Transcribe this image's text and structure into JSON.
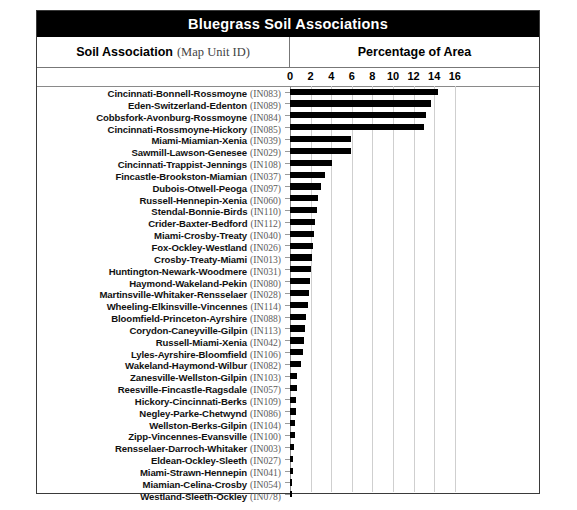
{
  "title": "Bluegrass Soil Associations",
  "header": {
    "left_bold": "Soil Association",
    "left_light": "(Map Unit ID)",
    "right": "Percentage of Area"
  },
  "chart_data": {
    "type": "bar",
    "orientation": "horizontal",
    "title": "Bluegrass Soil Associations",
    "xlabel": "Percentage of Area",
    "ylabel": "Soil Association (Map Unit ID)",
    "xlim": [
      0,
      16
    ],
    "xticks": [
      0,
      2,
      4,
      6,
      8,
      10,
      12,
      14,
      16
    ],
    "xtick_labels": [
      "0",
      "2",
      "4",
      "6",
      "8",
      "10",
      "12",
      "14",
      "16"
    ],
    "grid": true,
    "legend": false,
    "bar_color": "#000000",
    "categories": [
      "Cincinnati-Bonnell-Rossmoyne",
      "Eden-Switzerland-Edenton",
      "Cobbsfork-Avonburg-Rossmoyne",
      "Cincinnati-Rossmoyne-Hickory",
      "Miami-Miamian-Xenia",
      "Sawmill-Lawson-Genesee",
      "Cincinnati-Trappist-Jennings",
      "Fincastle-Brookston-Miamian",
      "Dubois-Otwell-Peoga",
      "Russell-Hennepin-Xenia",
      "Stendal-Bonnie-Birds",
      "Crider-Baxter-Bedford",
      "Miami-Crosby-Treaty",
      "Fox-Ockley-Westland",
      "Crosby-Treaty-Miami",
      "Huntington-Newark-Woodmere",
      "Haymond-Wakeland-Pekin",
      "Martinsville-Whitaker-Rensselaer",
      "Wheeling-Elkinsville-Vincennes",
      "Bloomfield-Princeton-Ayrshire",
      "Corydon-Caneyville-Gilpin",
      "Russell-Miami-Xenia",
      "Lyles-Ayrshire-Bloomfield",
      "Wakeland-Haymond-Wilbur",
      "Zanesville-Wellston-Gilpin",
      "Reesville-Fincastle-Ragsdale",
      "Hickory-Cincinnati-Berks",
      "Negley-Parke-Chetwynd",
      "Wellston-Berks-Gilpin",
      "Zipp-Vincennes-Evansville",
      "Rensselaer-Darroch-Whitaker",
      "Eldean-Ockley-Sleeth",
      "Miami-Strawn-Hennepin",
      "Miamian-Celina-Crosby",
      "Westland-Sleeth-Ockley"
    ],
    "map_unit_ids": [
      "(IN083)",
      "(IN089)",
      "(IN084)",
      "(IN085)",
      "(IN039)",
      "(IN029)",
      "(IN108)",
      "(IN037)",
      "(IN097)",
      "(IN060)",
      "(IN110)",
      "(IN112)",
      "(IN040)",
      "(IN026)",
      "(IN013)",
      "(IN031)",
      "(IN080)",
      "(IN028)",
      "(IN114)",
      "(IN088)",
      "(IN113)",
      "(IN042)",
      "(IN106)",
      "(IN082)",
      "(IN103)",
      "(IN057)",
      "(IN109)",
      "(IN086)",
      "(IN104)",
      "(IN100)",
      "(IN003)",
      "(IN027)",
      "(IN041)",
      "(IN054)",
      "(IN078)"
    ],
    "values": [
      14.4,
      13.7,
      13.2,
      13.0,
      5.9,
      5.9,
      4.1,
      3.4,
      3.0,
      2.7,
      2.6,
      2.4,
      2.3,
      2.2,
      2.1,
      2.0,
      1.9,
      1.8,
      1.7,
      1.6,
      1.5,
      1.4,
      1.3,
      1.1,
      0.7,
      0.65,
      0.6,
      0.55,
      0.5,
      0.45,
      0.4,
      0.3,
      0.25,
      0.2,
      0.15
    ],
    "value_unit": "percent"
  }
}
